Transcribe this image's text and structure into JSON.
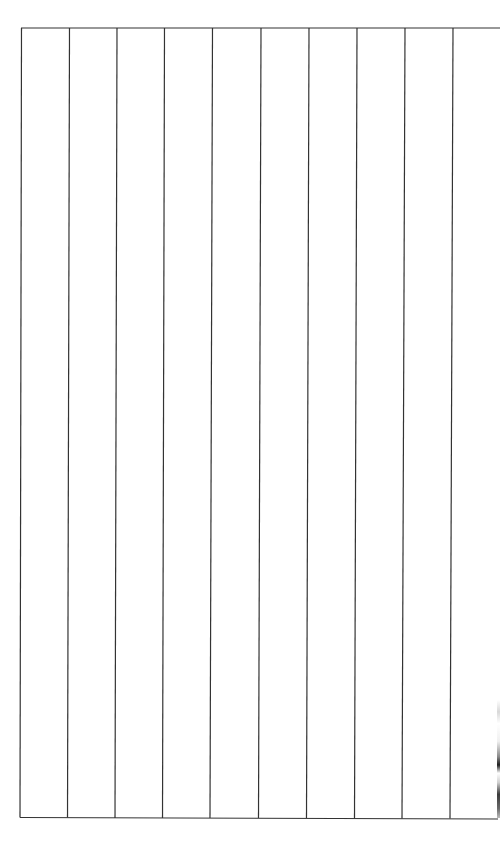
{
  "document": {
    "type": "blank-ruled-grid",
    "columns_visible": 10,
    "rows": 1,
    "border_color": "#333333",
    "background_color": "#ffffff",
    "cells": [
      "",
      "",
      "",
      "",
      "",
      "",
      "",
      "",
      "",
      ""
    ]
  }
}
